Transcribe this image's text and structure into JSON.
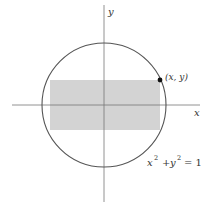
{
  "diagram": {
    "type": "geometry",
    "axes": {
      "x_label": "x",
      "y_label": "y"
    },
    "circle": {
      "equation_lhs_x": "x",
      "equation_lhs_y": "y",
      "exponent": "2",
      "plus": "+",
      "equals": "= 1",
      "stroke_color": "#555555"
    },
    "rectangle": {
      "fill_color": "#d3d3d3"
    },
    "point": {
      "label": "(x, y)",
      "color": "#111111"
    },
    "axis_color": "#777777"
  }
}
